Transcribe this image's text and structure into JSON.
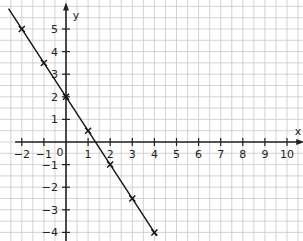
{
  "chart_data": {
    "type": "line",
    "title": "",
    "xlabel": "x",
    "ylabel": "y",
    "xlim": [
      -2,
      10
    ],
    "ylim": [
      -4,
      5
    ],
    "grid": true,
    "grid_step": 0.5,
    "x_ticks": [
      -2,
      -1,
      0,
      1,
      2,
      3,
      4,
      5,
      6,
      7,
      8,
      9,
      10
    ],
    "y_ticks": [
      -4,
      -3,
      -2,
      -1,
      1,
      2,
      3,
      4,
      5
    ],
    "origin_label": "0",
    "series": [
      {
        "name": "y = -1.5x + 2",
        "equation": "y = -1.5x + 2",
        "x": [
          -2,
          -1,
          0,
          1,
          2,
          3,
          4
        ],
        "y": [
          5,
          3.5,
          2,
          0.5,
          -1,
          -2.5,
          -4
        ],
        "marker": "x",
        "color": "#111111"
      }
    ]
  },
  "layout": {
    "origin_px": [
      66,
      142
    ],
    "unit_x_px": 22.1,
    "unit_y_px": 22.6,
    "grid_color": "#c8c8c8",
    "axis_color": "#222222"
  }
}
